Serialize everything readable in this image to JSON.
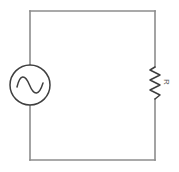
{
  "figure": {
    "background_color": "#ffffff",
    "width": 179,
    "height": 172
  },
  "style": {
    "wire_color": "#8c8c8c",
    "wire_width": 1.6,
    "component_color": "#3f3f3f",
    "component_width": 1.5,
    "label_color": "#5a5a5a",
    "label_font_size": 8
  },
  "circuit": {
    "loop": {
      "left_x": 30,
      "right_x": 155,
      "top_y": 11,
      "bottom_y": 160
    },
    "source": {
      "type": "ac-voltage-source",
      "symbol": "sine-wave-in-circle",
      "center_x": 30,
      "center_y": 85,
      "radius": 20,
      "label": ""
    },
    "resistor": {
      "type": "resistor",
      "symbol": "zigzag",
      "center_x": 155,
      "top_y": 67,
      "bottom_y": 99,
      "amplitude": 5,
      "peaks": 6,
      "label": "R",
      "label_x": 166,
      "label_y": 82,
      "label_rotation": 90
    }
  },
  "paths": {
    "top_wire": "M 30 11 L 155 11",
    "bottom_wire": "M 30 160 L 155 160",
    "left_wire_upper": "M 30 11 L 30 65",
    "left_wire_lower": "M 30 105 L 30 160",
    "right_wire_upper": "M 155 11 L 155 67",
    "right_wire_lower": "M 155 99 L 155 160",
    "sine_wave": "M 17 87 C 20 74, 25 74, 29.5 85 C 34 96, 39 96, 43 83",
    "resistor_zigzag": "M 155 67 L 150 70 L 160 75 L 150 80 L 160 85 L 150 90 L 160 95 L 155 99"
  }
}
